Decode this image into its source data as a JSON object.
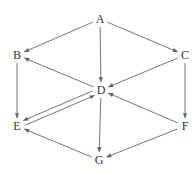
{
  "diagram": {
    "type": "directed-graph",
    "nodes": [
      {
        "id": "A",
        "label": "A",
        "x": 100,
        "y": 19
      },
      {
        "id": "B",
        "label": "B",
        "x": 17,
        "y": 55
      },
      {
        "id": "C",
        "label": "C",
        "x": 185,
        "y": 55
      },
      {
        "id": "D",
        "label": "D",
        "x": 101,
        "y": 90
      },
      {
        "id": "E",
        "label": "E",
        "x": 17,
        "y": 126
      },
      {
        "id": "F",
        "label": "F",
        "x": 185,
        "y": 126
      },
      {
        "id": "G",
        "label": "G",
        "x": 99,
        "y": 160
      }
    ],
    "edges": [
      {
        "from": "A",
        "to": "B"
      },
      {
        "from": "A",
        "to": "C"
      },
      {
        "from": "A",
        "to": "D"
      },
      {
        "from": "D",
        "to": "B"
      },
      {
        "from": "C",
        "to": "D"
      },
      {
        "from": "B",
        "to": "E"
      },
      {
        "from": "C",
        "to": "F"
      },
      {
        "from": "F",
        "to": "D"
      },
      {
        "from": "D",
        "to": "E"
      },
      {
        "from": "E",
        "to": "D"
      },
      {
        "from": "D",
        "to": "G"
      },
      {
        "from": "F",
        "to": "G"
      },
      {
        "from": "G",
        "to": "E"
      }
    ],
    "colors": {
      "edge": "#666666",
      "label": "#333333",
      "background": "#ffffff"
    }
  }
}
